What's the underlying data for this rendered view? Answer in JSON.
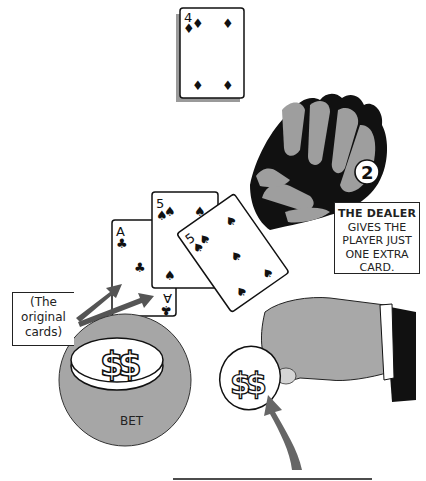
{
  "illustration": {
    "title": "Blackjack double down illustration",
    "step_number": "2",
    "caption": {
      "heading": "THE DEALER",
      "body_lines": [
        "GIVES THE",
        "PLAYER JUST",
        "ONE EXTRA",
        "CARD."
      ]
    },
    "original_cards_note": {
      "lines": [
        "(The",
        "original",
        "cards)"
      ]
    },
    "bet_label": "BET",
    "cards": [
      {
        "rank": "4",
        "suit": "diamonds",
        "suit_glyph": "♦",
        "role": "deck-top"
      },
      {
        "rank": "A",
        "suit": "clubs",
        "suit_glyph": "♣",
        "role": "original-card-1"
      },
      {
        "rank": "5",
        "suit": "spades",
        "suit_glyph": "♠",
        "role": "original-card-2"
      },
      {
        "rank": "5",
        "suit": "spades",
        "suit_glyph": "♠",
        "role": "extra-card"
      }
    ],
    "coin_symbol": "$",
    "colors": {
      "shadow_gray": "#9a9a9a",
      "table_gray": "#a6a6a6",
      "arrow_gray": "#666666",
      "ink": "#111111"
    }
  }
}
